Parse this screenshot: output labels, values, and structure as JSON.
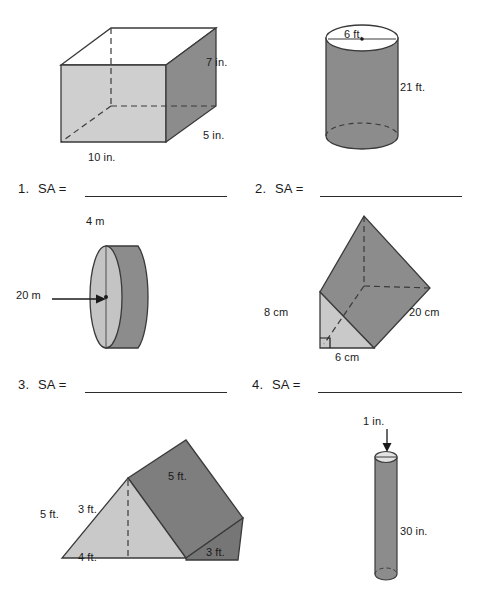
{
  "page": {
    "background": "#ffffff",
    "ink": "#1a1a1a",
    "palette": {
      "face_light": "#cfcfcf",
      "face_mid": "#b8b8b8",
      "face_dark": "#8c8c8c",
      "face_darker": "#7e7e7e",
      "face_white": "#ffffff",
      "outline": "#3a3a3a",
      "dashed": "#3a3a3a",
      "rule": "#2b2b2b"
    }
  },
  "problems": [
    {
      "number": "1.",
      "prompt": "SA =",
      "shape": "rectangular-prism",
      "labels": [
        {
          "text": "7 in.",
          "role": "height"
        },
        {
          "text": "5 in.",
          "role": "depth"
        },
        {
          "text": "10 in.",
          "role": "length"
        }
      ]
    },
    {
      "number": "2.",
      "prompt": "SA =",
      "shape": "cylinder-vertical",
      "labels": [
        {
          "text": "6 ft.",
          "role": "diameter"
        },
        {
          "text": "21 ft.",
          "role": "height"
        }
      ]
    },
    {
      "number": "3.",
      "prompt": "SA =",
      "shape": "cylinder-disc",
      "labels": [
        {
          "text": "4 m",
          "role": "height"
        },
        {
          "text": "20 m",
          "role": "diameter"
        }
      ]
    },
    {
      "number": "4.",
      "prompt": "SA =",
      "shape": "triangular-prism-upright",
      "labels": [
        {
          "text": "8 cm",
          "role": "leg"
        },
        {
          "text": "20 cm",
          "role": "length"
        },
        {
          "text": "6 cm",
          "role": "base"
        }
      ]
    },
    {
      "number": "5.",
      "prompt": "",
      "shape": "triangular-prism-lying",
      "labels": [
        {
          "text": "5 ft.",
          "role": "slant-left"
        },
        {
          "text": "5 ft.",
          "role": "slant-right"
        },
        {
          "text": "3 ft.",
          "role": "height"
        },
        {
          "text": "3 ft.",
          "role": "depth"
        },
        {
          "text": "4 ft.",
          "role": "base"
        }
      ]
    },
    {
      "number": "6.",
      "prompt": "",
      "shape": "cylinder-thin",
      "labels": [
        {
          "text": "1 in.",
          "role": "diameter"
        },
        {
          "text": "30 in.",
          "role": "height"
        }
      ]
    }
  ]
}
